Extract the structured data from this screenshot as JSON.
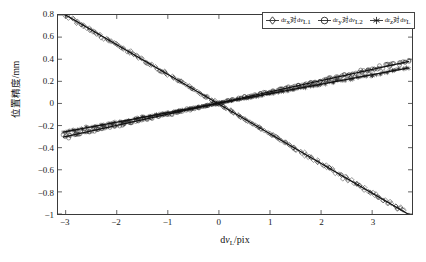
{
  "chart_data": {
    "type": "scatter",
    "title": "",
    "xlabel": "dvL/pix",
    "ylabel": "位置精度/mm",
    "xlim": [
      -3.15,
      3.78
    ],
    "ylim": [
      -1.0,
      0.8
    ],
    "xticks": [
      "-3",
      "-2",
      "-1",
      "0",
      "1",
      "2",
      "3"
    ],
    "xtick_values": [
      -3,
      -2,
      -1,
      0,
      1,
      2,
      3
    ],
    "yticks": [
      "0.8",
      "0.6",
      "0.4",
      "0.2",
      "0",
      "-0.2",
      "-0.4",
      "-0.6",
      "-0.8",
      "-1"
    ],
    "ytick_values": [
      0.8,
      0.6,
      0.4,
      0.2,
      0,
      -0.2,
      -0.4,
      -0.6,
      -0.8,
      -1
    ],
    "grid": false,
    "legend_position": "top-right",
    "series": [
      {
        "name": "drx对dvL1",
        "marker": "diamond",
        "color": "#111111",
        "fit_slope": -0.2686,
        "fit_intercept": -0.0058,
        "x_start": -3.05,
        "x_end": 3.72,
        "y_start": 0.8,
        "y_end": -1.0,
        "scatter_spread": 0.022,
        "n_points": 210
      },
      {
        "name": "dry对dvL2",
        "marker": "circle",
        "color": "#111111",
        "fit_slope": 0.1013,
        "fit_intercept": 0.0044,
        "x_start": -3.05,
        "x_end": 3.72,
        "y_start": -0.304,
        "y_end": 0.381,
        "scatter_spread": 0.018,
        "n_points": 210
      },
      {
        "name": "drz对dvL",
        "marker": "asterisk",
        "color": "#111111",
        "fit_slope": 0.0857,
        "fit_intercept": 0.0021,
        "x_start": -3.05,
        "x_end": 3.72,
        "y_start": -0.259,
        "y_end": 0.321,
        "scatter_spread": 0.015,
        "n_points": 210
      }
    ]
  },
  "axes": {
    "ylabel_text": "位置精度/mm",
    "xlabel_main": "d",
    "xlabel_var": "v",
    "xlabel_sub": "L",
    "xlabel_unit": "/pix"
  },
  "legend": {
    "items": [
      {
        "marker": "diamond",
        "pre": "dr",
        "sub1": "x",
        "mid": "对d",
        "var": "v",
        "sub2": "L1"
      },
      {
        "marker": "circle",
        "pre": "dr",
        "sub1": "y",
        "mid": "对d",
        "var": "v",
        "sub2": "L2"
      },
      {
        "marker": "asterisk",
        "pre": "dr",
        "sub1": "z",
        "mid": "对d",
        "var": "v",
        "sub2": "L"
      }
    ]
  }
}
